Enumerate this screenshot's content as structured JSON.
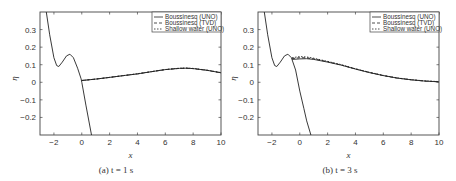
{
  "chart_data": [
    {
      "type": "line",
      "panel": "a",
      "caption": "(a) t = 1 s",
      "xlabel": "x",
      "ylabel": "η",
      "xlim": [
        -3,
        10
      ],
      "ylim": [
        -0.3,
        0.4
      ],
      "xticks": [
        -2,
        0,
        2,
        4,
        6,
        8,
        10
      ],
      "yticks": [
        -0.2,
        -0.1,
        0,
        0.1,
        0.2,
        0.3
      ],
      "grid": false,
      "legend_position": "upper right",
      "legend": [
        "Boussinesq (UNO)",
        "Boussinesq (TVD)",
        "Shallow water (UNO)"
      ],
      "series": [
        {
          "name": "Boussinesq (UNO)",
          "style": "solid",
          "x": [
            -2.55,
            -2.3,
            -2.0,
            -1.8,
            -1.65,
            -1.4,
            -1.1,
            -0.85,
            -0.6,
            -0.3,
            -0.05,
            0.0,
            0.3,
            0.7
          ],
          "y": [
            0.4,
            0.27,
            0.14,
            0.095,
            0.09,
            0.115,
            0.15,
            0.16,
            0.14,
            0.08,
            0.02,
            0.0,
            -0.13,
            -0.3
          ]
        },
        {
          "name": "Boussinesq (UNO) - right wave",
          "style": "solid",
          "x": [
            0.0,
            1,
            2,
            3,
            4,
            5,
            6,
            7,
            7.5,
            8,
            9,
            10
          ],
          "y": [
            0.01,
            0.018,
            0.028,
            0.038,
            0.048,
            0.06,
            0.072,
            0.079,
            0.08,
            0.078,
            0.068,
            0.054
          ]
        },
        {
          "name": "Boussinesq (TVD)",
          "style": "dashed",
          "x": [
            0.0,
            1,
            2,
            3,
            4,
            5,
            6,
            7,
            7.5,
            8,
            9,
            10
          ],
          "y": [
            0.01,
            0.018,
            0.028,
            0.038,
            0.048,
            0.06,
            0.072,
            0.079,
            0.08,
            0.078,
            0.068,
            0.054
          ]
        },
        {
          "name": "Shallow water (UNO)",
          "style": "dotted",
          "x": [
            0.0,
            1,
            2,
            3,
            4,
            5,
            6,
            7,
            7.5,
            8,
            9,
            10
          ],
          "y": [
            0.01,
            0.018,
            0.028,
            0.038,
            0.049,
            0.061,
            0.073,
            0.08,
            0.081,
            0.079,
            0.069,
            0.055
          ]
        }
      ]
    },
    {
      "type": "line",
      "panel": "b",
      "caption": "(b) t = 3 s",
      "xlabel": "x",
      "ylabel": "η",
      "xlim": [
        -3,
        10
      ],
      "ylim": [
        -0.3,
        0.4
      ],
      "xticks": [
        -2,
        0,
        2,
        4,
        6,
        8,
        10
      ],
      "yticks": [
        -0.2,
        -0.1,
        0,
        0.1,
        0.2,
        0.3
      ],
      "grid": false,
      "legend_position": "upper right",
      "legend": [
        "Boussinesq (UNO)",
        "Boussinesq (TVD)",
        "Shallow water (UNO)"
      ],
      "series": [
        {
          "name": "Boussinesq (UNO)",
          "style": "solid",
          "x": [
            -2.55,
            -2.3,
            -2.0,
            -1.8,
            -1.65,
            -1.4,
            -1.1,
            -0.85,
            -0.6,
            -0.3,
            0.0,
            0.3,
            0.5,
            0.8
          ],
          "y": [
            0.4,
            0.27,
            0.14,
            0.095,
            0.09,
            0.115,
            0.15,
            0.16,
            0.14,
            0.07,
            -0.05,
            -0.15,
            -0.22,
            -0.3
          ]
        },
        {
          "name": "Boussinesq (UNO) - right wave",
          "style": "solid",
          "x": [
            -0.55,
            0,
            0.5,
            1,
            2,
            3,
            4,
            5,
            6,
            7,
            8,
            9,
            10
          ],
          "y": [
            0.13,
            0.133,
            0.134,
            0.13,
            0.115,
            0.097,
            0.075,
            0.055,
            0.038,
            0.024,
            0.014,
            0.007,
            0.003
          ]
        },
        {
          "name": "Boussinesq (TVD)",
          "style": "dashed",
          "x": [
            -0.55,
            0,
            0.5,
            1,
            2,
            3,
            4,
            5,
            6,
            7,
            8,
            9,
            10
          ],
          "y": [
            0.135,
            0.14,
            0.139,
            0.133,
            0.117,
            0.098,
            0.076,
            0.056,
            0.038,
            0.024,
            0.014,
            0.007,
            0.003
          ]
        },
        {
          "name": "Shallow water (UNO)",
          "style": "dotted",
          "x": [
            -0.55,
            0,
            0.5,
            1,
            2,
            3,
            4,
            5,
            6,
            7,
            8,
            9,
            10
          ],
          "y": [
            0.14,
            0.146,
            0.144,
            0.137,
            0.119,
            0.1,
            0.077,
            0.057,
            0.039,
            0.025,
            0.015,
            0.008,
            0.004
          ]
        }
      ]
    }
  ]
}
